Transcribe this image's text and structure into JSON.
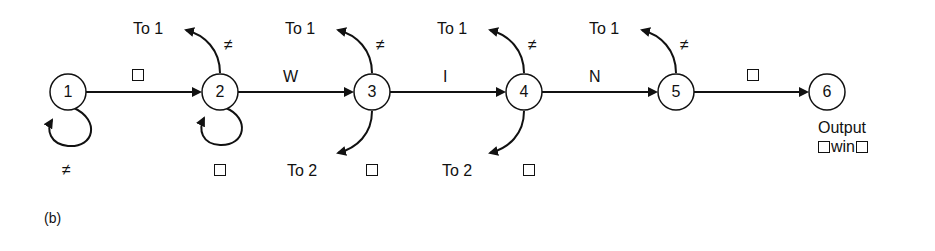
{
  "figure_label": "(b)",
  "nodes": [
    {
      "id": "1",
      "label": "1"
    },
    {
      "id": "2",
      "label": "2"
    },
    {
      "id": "3",
      "label": "3"
    },
    {
      "id": "4",
      "label": "4"
    },
    {
      "id": "5",
      "label": "5"
    },
    {
      "id": "6",
      "label": "6"
    }
  ],
  "edges": {
    "e12": "□",
    "e23": "W",
    "e34": "I",
    "e45": "N",
    "e56": "□"
  },
  "self_loops": {
    "loop1": "≠",
    "loop2": "□"
  },
  "branches": {
    "n2_up_label": "To 1",
    "n2_up_sym": "≠",
    "n3_up_label": "To 1",
    "n3_up_sym": "≠",
    "n3_down_label": "To 2",
    "n3_down_sym": "□",
    "n4_up_label": "To 1",
    "n4_up_sym": "≠",
    "n4_down_label": "To 2",
    "n4_down_sym": "□",
    "n5_up_label": "To 1",
    "n5_up_sym": "≠"
  },
  "output": {
    "title": "Output",
    "word": "win"
  }
}
